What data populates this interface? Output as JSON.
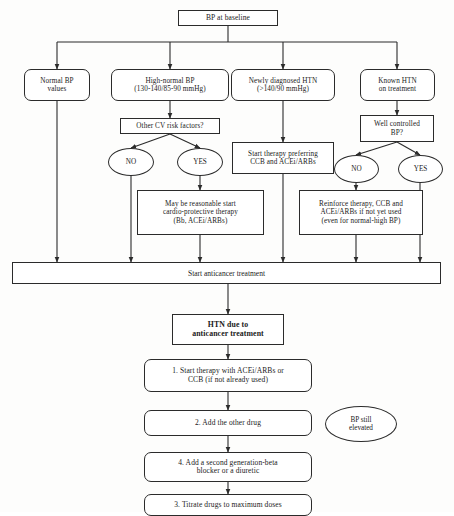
{
  "diagram": {
    "root": {
      "label": "BP at baseline"
    },
    "branches": [
      {
        "id": "normal-bp",
        "label": "Normal BP\nvalues"
      },
      {
        "id": "high-normal-bp",
        "label": "High-normal BP\n(130-140/85-90 mmHg)"
      },
      {
        "id": "newly-diagnosed-htn",
        "label": "Newly diagnosed HTN\n(>140/90 mmHg)"
      },
      {
        "id": "known-htn",
        "label": "Known HTN\non treatment"
      }
    ],
    "decisions": [
      {
        "id": "other-cv-risk",
        "label": "Other CV risk factors?"
      },
      {
        "id": "well-controlled-bp",
        "label": "Well controlled\nBP?"
      }
    ],
    "answers": {
      "no": "NO",
      "yes": "YES"
    },
    "actions": [
      {
        "id": "start-therapy-preferring",
        "label": "Start therapy preferring\nCCB and ACEi/ARBs"
      },
      {
        "id": "may-be-reasonable",
        "label": "May be reasonable start\ncardio-protective therapy\n(Bb, ACEi/ARBs)"
      },
      {
        "id": "reinforce-therapy",
        "label": "Reinforce therapy, CCB and\nACEi/ARBs if not yet used\n(even for normal-high BP)"
      }
    ],
    "convergence_bar": {
      "label": "Start anticancer treatment"
    },
    "outcome": {
      "label": "HTN due to\nanticancer treatment"
    },
    "steps": [
      {
        "id": "step-1",
        "label": "1. Start therapy with ACEi/ARBs or\nCCB (if not already used)"
      },
      {
        "id": "step-2",
        "label": "2. Add the other drug"
      },
      {
        "id": "step-4",
        "label": "4. Add a second generation-beta\nblocker or a diuretic"
      },
      {
        "id": "step-3",
        "label": "3. Titrate drugs to maximum doses"
      }
    ],
    "side_note": {
      "label": "BP still\nelevated"
    },
    "colors": {
      "stroke": "#2b2b2b",
      "background": "#fdfdfc",
      "node_fill": "#ffffff",
      "text": "#1a1a1a"
    }
  }
}
